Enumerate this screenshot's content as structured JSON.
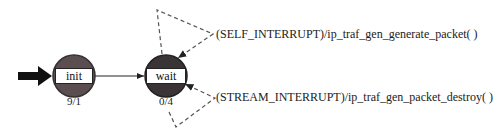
{
  "diagram": {
    "type": "state-machine",
    "states": [
      {
        "id": "init",
        "label": "init",
        "count": "9/1",
        "initial": true,
        "fill": "#5a4e50"
      },
      {
        "id": "wait",
        "label": "wait",
        "count": "0/4",
        "initial": false,
        "fill": "#3a3436"
      }
    ],
    "transitions": [
      {
        "from": "init",
        "to": "wait",
        "label": "",
        "style": "solid"
      },
      {
        "from": "wait",
        "to": "wait",
        "label": "(SELF_INTERRUPT)/ip_traf_gen_generate_packet( )",
        "style": "dashed"
      },
      {
        "from": "wait",
        "to": "wait",
        "label": "(STREAM_INTERRUPT)/ip_traf_gen_packet_destroy( )",
        "style": "dashed"
      }
    ]
  }
}
